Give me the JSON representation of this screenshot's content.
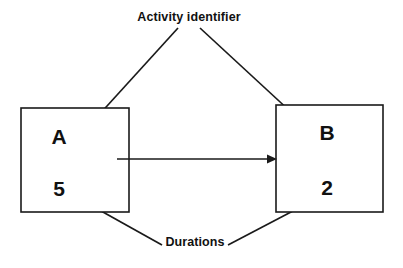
{
  "diagram": {
    "background_color": "#ffffff",
    "line_color": "#1a1a1a",
    "text_color": "#111111",
    "nodes": [
      {
        "id": "node-a",
        "letter": "A",
        "duration": "5",
        "box": {
          "x": 21,
          "y": 108,
          "width": 108,
          "height": 104
        },
        "letter_pos": {
          "x": 59,
          "y": 138
        },
        "duration_pos": {
          "x": 59,
          "y": 190
        }
      },
      {
        "id": "node-b",
        "letter": "B",
        "duration": "2",
        "box": {
          "x": 276,
          "y": 105,
          "width": 107,
          "height": 107
        },
        "letter_pos": {
          "x": 327,
          "y": 134
        },
        "duration_pos": {
          "x": 327,
          "y": 189
        }
      }
    ],
    "flow_arrow": {
      "from_x": 117,
      "to_x": 277,
      "y": 159
    },
    "annotations": [
      {
        "id": "activity-identifier",
        "label": "Activity identifier",
        "text_pos": {
          "x": 189,
          "y": 18
        },
        "leaders": [
          {
            "x1": 178,
            "y1": 28,
            "x2": 87,
            "y2": 128
          },
          {
            "x1": 200,
            "y1": 28,
            "x2": 305,
            "y2": 125
          }
        ]
      },
      {
        "id": "durations",
        "label": "Durations",
        "text_pos": {
          "x": 195,
          "y": 243
        },
        "leaders": [
          {
            "x1": 162,
            "y1": 245,
            "x2": 85,
            "y2": 202
          },
          {
            "x1": 228,
            "y1": 245,
            "x2": 312,
            "y2": 201
          }
        ]
      }
    ]
  }
}
